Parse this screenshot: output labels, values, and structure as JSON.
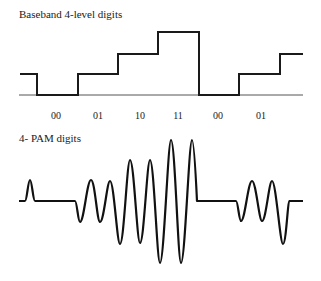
{
  "baseband": {
    "title": "Baseband 4-level digits",
    "digits": [
      {
        "label": "00",
        "x": 56
      },
      {
        "label": "01",
        "x": 98
      },
      {
        "label": "10",
        "x": 140
      },
      {
        "label": "11",
        "x": 178
      },
      {
        "label": "00",
        "x": 218
      },
      {
        "label": "01",
        "x": 261
      }
    ],
    "line_color": "#1a1a1a",
    "axis_color": "#555555"
  },
  "pam": {
    "title": "4- PAM digits",
    "line_color": "#111111"
  }
}
